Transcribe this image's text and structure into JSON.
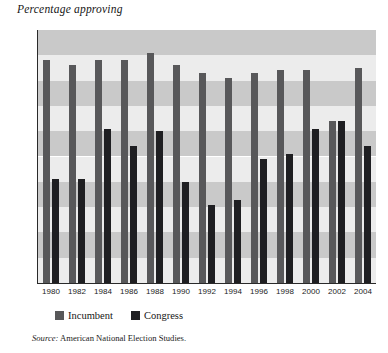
{
  "chart_data": {
    "type": "bar",
    "title": "Percentage approving",
    "xlabel": "",
    "ylabel": "Percentage approving",
    "ylim": [
      0,
      100
    ],
    "ytick_step": 10,
    "yticks": [
      0,
      10,
      20,
      30,
      40,
      50,
      60,
      70,
      80,
      90,
      100
    ],
    "categories": [
      "1980",
      "1982",
      "1984",
      "1986",
      "1988",
      "1990",
      "1992",
      "1994",
      "1996",
      "1998",
      "2000",
      "2002",
      "2004"
    ],
    "series": [
      {
        "name": "Incumbent",
        "color": "#58585a",
        "values": [
          88,
          86,
          88,
          88,
          91,
          86,
          83,
          81,
          83,
          84,
          84,
          64,
          85
        ]
      },
      {
        "name": "Congress",
        "color": "#1f1f22",
        "values": [
          41,
          41,
          61,
          54,
          60,
          40,
          31,
          33,
          49,
          51,
          61,
          64,
          54
        ]
      }
    ],
    "legend_position": "bottom-left",
    "grid": "horizontal-bands",
    "band_color_light": "#ececec",
    "band_color_dark": "#c9c9c9"
  },
  "source": {
    "keyword": "Source:",
    "text": " American National Election Studies."
  }
}
